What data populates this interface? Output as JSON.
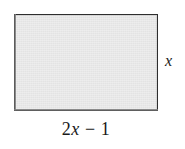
{
  "figure": {
    "type": "geometry-diagram",
    "shape": "rectangle",
    "background_color": "#ffffff",
    "fill_color": "#ededed",
    "stroke_color": "#3a3a3a",
    "text_color": "#1a1a1a",
    "labels": {
      "height": "x",
      "width_full": "2x − 1",
      "width_coefficient": "2",
      "width_variable": "x",
      "width_operator": "−",
      "width_constant": "1"
    }
  },
  "chart_data": {
    "type": "diagram",
    "title": "",
    "shape": "rectangle",
    "dimensions": [
      {
        "side": "width",
        "position": "bottom",
        "expression": "2x - 1"
      },
      {
        "side": "height",
        "position": "right",
        "expression": "x"
      }
    ],
    "annotations": [
      "2x − 1",
      "x"
    ]
  }
}
